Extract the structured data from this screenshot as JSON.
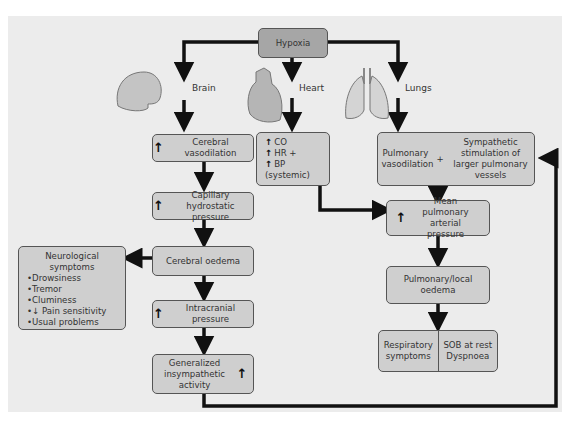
{
  "top": {
    "label": "Hypoxia"
  },
  "organs": {
    "brain": "Brain",
    "heart": "Heart",
    "lungs": "Lungs"
  },
  "brain_chain": {
    "vasodilation": "Cerebral vasodilation",
    "capillary": "Capillary hydrostatic pressure",
    "oedema": "Cerebral oedema",
    "icp": "Intracranial pressure",
    "sympathetic": "Generalized insympathetic activity"
  },
  "neuro": {
    "title": "Neurological symptoms",
    "items": [
      "Drowsiness",
      "Tremor",
      "Cluminess",
      "↓ Pain sensitivity",
      "Usual problems"
    ]
  },
  "heart_box": {
    "lines": [
      "CO",
      "HR +",
      "BP (systemic)"
    ]
  },
  "lungs_chain": {
    "pulm_vaso": "Pulmonary vasodilation",
    "plus": "+",
    "symp_stim": "Sympathetic stimulation of larger pulmonary vessels",
    "mean_pap": "Mean pulmonary arterial pressure",
    "local_oedema": "Pulmonary/local oedema",
    "resp": "Respiratory symptoms",
    "sob": "SOB at rest Dyspnoea"
  }
}
